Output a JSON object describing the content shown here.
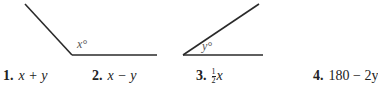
{
  "figures": [
    {
      "id": "angle-x",
      "label": "x°",
      "variable": "x",
      "type": "obtuse"
    },
    {
      "id": "angle-y",
      "label": "y°",
      "variable": "y",
      "type": "acute"
    }
  ],
  "choices": [
    {
      "number": "1.",
      "expression": "x + y"
    },
    {
      "number": "2.",
      "expression": "x − y"
    },
    {
      "number": "3.",
      "expression_fraction": {
        "numerator": "1",
        "denominator": "2"
      },
      "expression": "x"
    },
    {
      "number": "4.",
      "expression": "180 − 2y"
    }
  ],
  "colors": {
    "line": "#2a2a2a",
    "label": "#555555",
    "text": "#222222"
  }
}
